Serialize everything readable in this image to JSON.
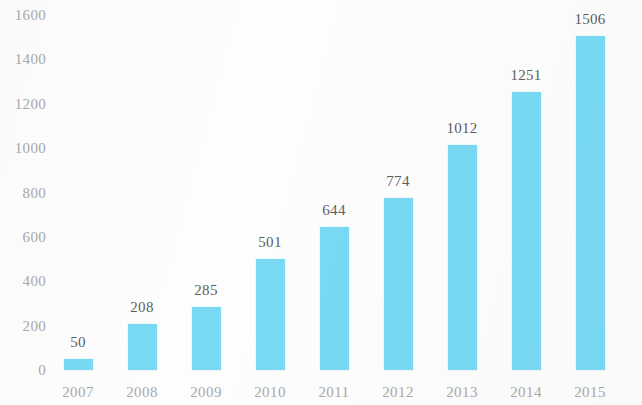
{
  "chart_data": {
    "type": "bar",
    "title": "",
    "xlabel": "",
    "ylabel": "",
    "categories": [
      "2007",
      "2008",
      "2009",
      "2010",
      "2011",
      "2012",
      "2013",
      "2014",
      "2015"
    ],
    "values": [
      50,
      208,
      285,
      501,
      644,
      774,
      1012,
      1251,
      1506
    ],
    "value_labels": [
      "50",
      "208",
      "285",
      "501",
      "644",
      "774",
      "1012",
      "1251",
      "1506"
    ],
    "ylim": [
      0,
      1600
    ],
    "y_ticks": [
      0,
      200,
      400,
      600,
      800,
      1000,
      1200,
      1400,
      1600
    ],
    "y_tick_labels": [
      "0",
      "200",
      "400",
      "600",
      "800",
      "1000",
      "1200",
      "1400",
      "1600"
    ],
    "grid": false,
    "legend": null,
    "legend_position": "none",
    "series": [
      {
        "name": "",
        "values": [
          50,
          208,
          285,
          501,
          644,
          774,
          1012,
          1251,
          1506
        ]
      }
    ]
  },
  "colors": {
    "bar": "#79d9f4",
    "tick_label": "#a9a9a9",
    "value_label": "#5d5d5d",
    "background": "#fdfdfd"
  }
}
